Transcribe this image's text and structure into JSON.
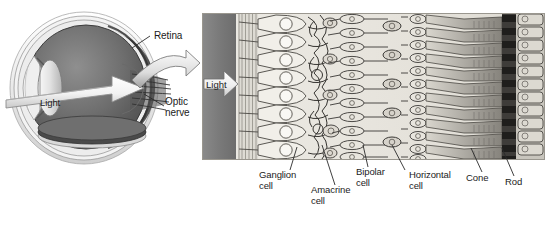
{
  "figure": {
    "type": "biology-diagram",
    "background_color": "#ffffff"
  },
  "eye_diagram": {
    "name": "eye-cross-section",
    "light_arrow_label": "Light",
    "labels": [
      {
        "id": "retina",
        "text": "Retina",
        "x": 152,
        "y": 28
      },
      {
        "id": "optic-nerve",
        "line1": "Optic",
        "line2": "nerve",
        "x": 163,
        "y": 96
      }
    ]
  },
  "retina_panel": {
    "name": "retina-cross-section",
    "light_arrow_label": "Light",
    "choroid_color": "#7c7c7c",
    "tissue_color": "#e9e7e1",
    "ink_color": "#2b2b2b",
    "layers": [
      "nerve fiber layer",
      "ganglion cell layer",
      "inner plexiform layer",
      "inner nuclear layer",
      "outer plexiform layer",
      "outer nuclear layer",
      "photoreceptor outer segments",
      "pigment epithelium"
    ]
  },
  "cell_labels": [
    {
      "id": "ganglion-cell",
      "line1": "Ganglion",
      "line2": "cell",
      "x": 259,
      "y": 173,
      "leader_x": 290,
      "leader_y1": 170,
      "leader_x2": 297,
      "leader_y2": 147
    },
    {
      "id": "amacrine-cell",
      "line1": "Amacrine",
      "line2": "cell",
      "x": 312,
      "y": 188,
      "leader_x": 335,
      "leader_y1": 185,
      "leader_x2": 322,
      "leader_y2": 145
    },
    {
      "id": "bipolar-cell",
      "line1": "Bipolar",
      "line2": "cell",
      "x": 357,
      "y": 170,
      "leader_x": 368,
      "leader_y1": 167,
      "leader_x2": 363,
      "leader_y2": 145
    },
    {
      "id": "horizontal-cell",
      "line1": "Horizontal",
      "line2": "cell",
      "x": 410,
      "y": 173,
      "leader_x": 405,
      "leader_y1": 170,
      "leader_x2": 392,
      "leader_y2": 145
    },
    {
      "id": "cone",
      "line1": "Cone",
      "line2": "",
      "x": 470,
      "y": 176,
      "leader_x": 482,
      "leader_y1": 172,
      "leader_x2": 471,
      "leader_y2": 148
    },
    {
      "id": "rod",
      "line1": "Rod",
      "line2": "",
      "x": 508,
      "y": 180,
      "leader_x": 514,
      "leader_y1": 176,
      "leader_x2": 502,
      "leader_y2": 148
    }
  ]
}
